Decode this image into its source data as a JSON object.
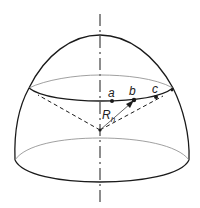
{
  "figure": {
    "colors": {
      "outline": "#1a1a1a",
      "thin": "#888888",
      "background": "#ffffff"
    }
  },
  "labels": {
    "a": "a",
    "b": "b",
    "c": "c",
    "radius_main": "R",
    "radius_sub": "h"
  }
}
